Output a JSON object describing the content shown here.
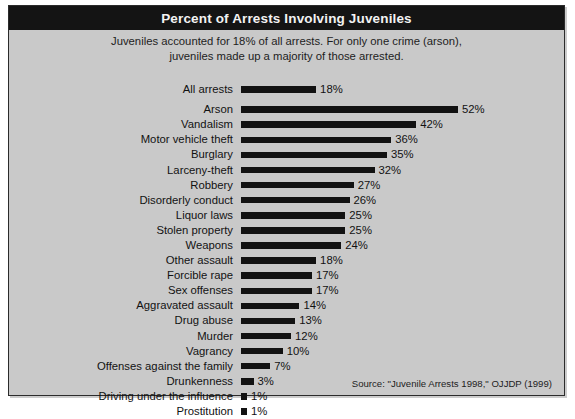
{
  "title": "Percent of Arrests Involving Juveniles",
  "subtitle_lines": [
    "Juveniles accounted for 18% of all arrests. For only one crime (arson),",
    "juveniles made up a majority of those arrested."
  ],
  "source": "Source: \"Juvenile Arrests 1998,\" OJJDP (1999)",
  "colors": {
    "panel_background": "#c9c9c9",
    "title_bar": "#141414",
    "title_text": "#f2f2f2",
    "bar": "#121212",
    "border": "#2b2b2b"
  },
  "chart_data": {
    "type": "bar",
    "orientation": "horizontal",
    "title": "Percent of Arrests Involving Juveniles",
    "subtitle": "Juveniles accounted for 18% of all arrests. For only one crime (arson), juveniles made up a majority of those arrested.",
    "xlabel": "",
    "ylabel": "",
    "xlim": [
      0,
      52
    ],
    "grid": false,
    "legend": false,
    "value_suffix": "%",
    "categories": [
      "All arrests",
      "Arson",
      "Vandalism",
      "Motor vehicle theft",
      "Burglary",
      "Larceny-theft",
      "Robbery",
      "Disorderly conduct",
      "Liquor laws",
      "Stolen property",
      "Weapons",
      "Other assault",
      "Forcible rape",
      "Sex offenses",
      "Aggravated assault",
      "Drug abuse",
      "Murder",
      "Vagrancy",
      "Offenses against the family",
      "Drunkenness",
      "Driving under the influence",
      "Prostitution"
    ],
    "values": [
      18,
      52,
      42,
      36,
      35,
      32,
      27,
      26,
      25,
      25,
      24,
      18,
      17,
      17,
      14,
      13,
      12,
      10,
      7,
      3,
      1,
      1
    ],
    "value_labels": [
      "18%",
      "52%",
      "42%",
      "36%",
      "35%",
      "32%",
      "27%",
      "26%",
      "25%",
      "25%",
      "24%",
      "18%",
      "17%",
      "17%",
      "14%",
      "13%",
      "12%",
      "10%",
      "7%",
      "3%",
      "1%",
      "1%"
    ],
    "bars": [
      {
        "label": "All arrests",
        "value": 18,
        "value_label": "18%",
        "separated": true
      },
      {
        "label": "Arson",
        "value": 52,
        "value_label": "52%",
        "separated": false
      },
      {
        "label": "Vandalism",
        "value": 42,
        "value_label": "42%",
        "separated": false
      },
      {
        "label": "Motor vehicle theft",
        "value": 36,
        "value_label": "36%",
        "separated": false
      },
      {
        "label": "Burglary",
        "value": 35,
        "value_label": "35%",
        "separated": false
      },
      {
        "label": "Larceny-theft",
        "value": 32,
        "value_label": "32%",
        "separated": false
      },
      {
        "label": "Robbery",
        "value": 27,
        "value_label": "27%",
        "separated": false
      },
      {
        "label": "Disorderly conduct",
        "value": 26,
        "value_label": "26%",
        "separated": false
      },
      {
        "label": "Liquor laws",
        "value": 25,
        "value_label": "25%",
        "separated": false
      },
      {
        "label": "Stolen property",
        "value": 25,
        "value_label": "25%",
        "separated": false
      },
      {
        "label": "Weapons",
        "value": 24,
        "value_label": "24%",
        "separated": false
      },
      {
        "label": "Other assault",
        "value": 18,
        "value_label": "18%",
        "separated": false
      },
      {
        "label": "Forcible rape",
        "value": 17,
        "value_label": "17%",
        "separated": false
      },
      {
        "label": "Sex offenses",
        "value": 17,
        "value_label": "17%",
        "separated": false
      },
      {
        "label": "Aggravated assault",
        "value": 14,
        "value_label": "14%",
        "separated": false
      },
      {
        "label": "Drug abuse",
        "value": 13,
        "value_label": "13%",
        "separated": false
      },
      {
        "label": "Murder",
        "value": 12,
        "value_label": "12%",
        "separated": false
      },
      {
        "label": "Vagrancy",
        "value": 10,
        "value_label": "10%",
        "separated": false
      },
      {
        "label": "Offenses against the family",
        "value": 7,
        "value_label": "7%",
        "separated": false
      },
      {
        "label": "Drunkenness",
        "value": 3,
        "value_label": "3%",
        "separated": false
      },
      {
        "label": "Driving under the influence",
        "value": 1,
        "value_label": "1%",
        "separated": false
      },
      {
        "label": "Prostitution",
        "value": 1,
        "value_label": "1%",
        "separated": false
      }
    ]
  }
}
